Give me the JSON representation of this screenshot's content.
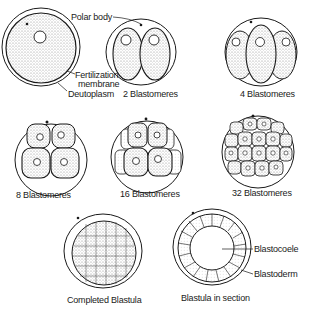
{
  "diagram": {
    "stages": [
      {
        "id": "zygote",
        "label": ""
      },
      {
        "id": "two_cell",
        "label": "2 Blastomeres"
      },
      {
        "id": "four_cell",
        "label": "4 Blastomeres"
      },
      {
        "id": "eight_cell",
        "label": "8 Blastomeres"
      },
      {
        "id": "sixteen_cell",
        "label": "16 Blastomeres"
      },
      {
        "id": "thirtytwo_cell",
        "label": "32 Blastomeres"
      },
      {
        "id": "completed_blastula",
        "label": "Completed Blastula"
      },
      {
        "id": "blastula_section",
        "label": "Blastula in section"
      }
    ],
    "annotations": {
      "polar_body": "Polar body",
      "fertilization_membrane_1": "Fertilization",
      "fertilization_membrane_2": "membrane",
      "deutoplasm": "Deutoplasm",
      "blastocoele": "Blastocoele",
      "blastoderm": "Blastoderm"
    },
    "colors": {
      "ink": "#1a1a1a",
      "stipple": "#cfcfcf",
      "background": "#ffffff"
    }
  }
}
